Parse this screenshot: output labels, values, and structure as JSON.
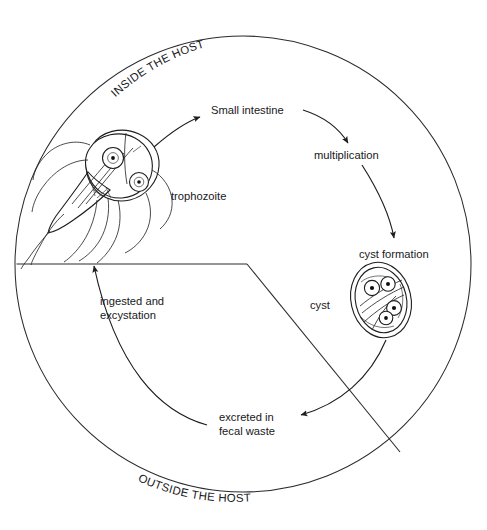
{
  "figure": {
    "type": "cycle-diagram",
    "background_color": "#ffffff",
    "ink_color": "#1d1d20"
  },
  "regions": {
    "inside_label": "INSIDE THE HOST",
    "outside_label": "OUTSIDE THE HOST",
    "boundary_shape": "circle",
    "wedge_description": "cut-away wedge separating inside-host region from outside-host region"
  },
  "stages": [
    {
      "id": "small-intestine",
      "label": "Small intestine",
      "x": 255,
      "y": 110
    },
    {
      "id": "multiplication",
      "label": "multiplication",
      "x": 355,
      "y": 155
    },
    {
      "id": "cyst-formation",
      "label": "cyst formation",
      "x": 393,
      "y": 254
    },
    {
      "id": "cyst",
      "label": "cyst",
      "x": 322,
      "y": 305
    },
    {
      "id": "excreted",
      "label": "excreted in",
      "label2": "fecal waste",
      "x": 250,
      "y": 419
    },
    {
      "id": "ingested",
      "label": "ingested and",
      "label2": "excystation",
      "x": 103,
      "y": 303
    },
    {
      "id": "trophozoite",
      "label": "trophozoite",
      "x": 171,
      "y": 196
    }
  ],
  "organisms": [
    {
      "id": "trophozoite-drawing",
      "name": "trophozoite",
      "shape": "pear-shaped cell with two nuclei and trailing flagella",
      "nuclei_count": 2
    },
    {
      "id": "cyst-drawing",
      "name": "cyst",
      "shape": "oval double-walled cyst containing four nuclei",
      "nuclei_count": 4
    }
  ],
  "arrows": [
    {
      "id": "trophozoite-to-small-intestine",
      "from": "trophozoite",
      "to": "small-intestine"
    },
    {
      "id": "small-intestine-to-multiplication",
      "from": "small-intestine",
      "to": "multiplication"
    },
    {
      "id": "multiplication-to-cyst-formation",
      "from": "multiplication",
      "to": "cyst-formation"
    },
    {
      "id": "cyst-to-excreted",
      "from": "cyst",
      "to": "excreted"
    },
    {
      "id": "excreted-to-trophozoite",
      "from": "excreted",
      "to": "trophozoite",
      "via": "ingested"
    }
  ]
}
